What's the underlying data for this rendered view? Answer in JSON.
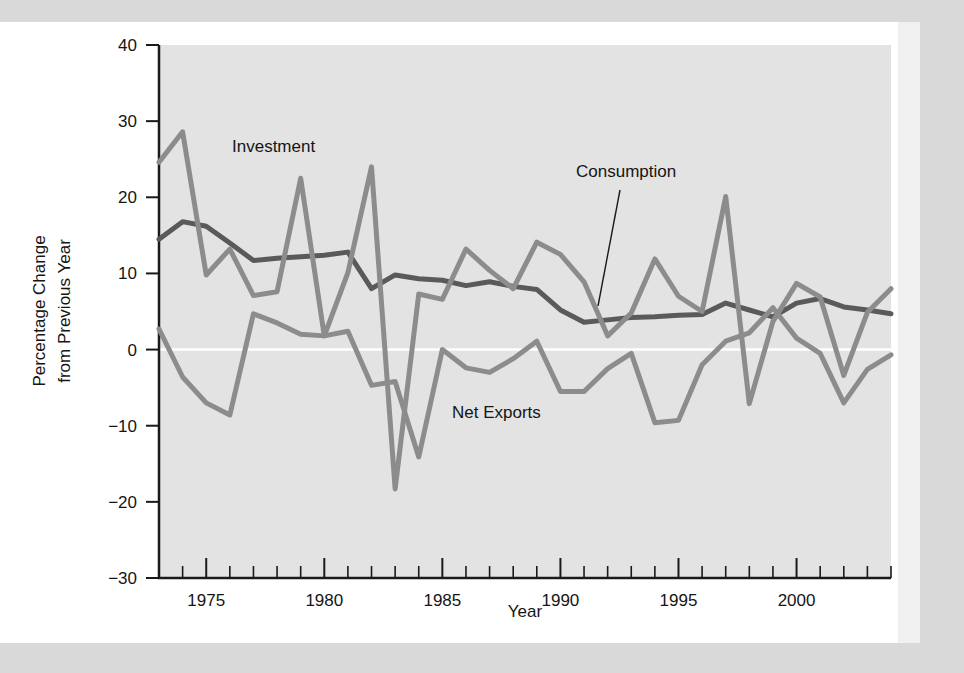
{
  "figure": {
    "background_color": "#ffffff",
    "scan_band_color": "#d9d9d9",
    "plot_background_color": "#e3e3e3",
    "axis_color": "#1a1a1a",
    "zero_line_color": "#ffffff"
  },
  "chart_data": {
    "type": "line",
    "title": "",
    "xlabel": "Year",
    "ylabel": "Percentage Change from Previous Year",
    "xlim": [
      1973,
      2004
    ],
    "ylim": [
      -30,
      40
    ],
    "yticks": [
      40,
      30,
      20,
      10,
      0,
      -10,
      -20,
      -30
    ],
    "ytick_labels": [
      "40",
      "30",
      "20",
      "10",
      "0",
      "−10",
      "−20",
      "−30"
    ],
    "xticks": [
      1975,
      1980,
      1985,
      1990,
      1995,
      2000
    ],
    "xtick_labels": [
      "1975",
      "1980",
      "1985",
      "1990",
      "1995",
      "2000"
    ],
    "x_minor_tick_interval": 1,
    "y_major_tick_interval": 10,
    "grid": false,
    "legend": "inline-annotations",
    "zero_reference_line": 0,
    "x": [
      1973,
      1974,
      1975,
      1976,
      1977,
      1978,
      1979,
      1980,
      1981,
      1982,
      1983,
      1984,
      1985,
      1986,
      1987,
      1988,
      1989,
      1990,
      1991,
      1992,
      1993,
      1994,
      1995,
      1996,
      1997,
      1998,
      1999,
      2000,
      2001,
      2002,
      2003,
      2004
    ],
    "series": [
      {
        "name": "Consumption",
        "color": "#5a5a5a",
        "width": 5,
        "values": [
          14.5,
          16.8,
          16.2,
          14.0,
          11.7,
          12.0,
          12.2,
          12.4,
          12.8,
          8.0,
          9.8,
          9.3,
          9.1,
          8.4,
          8.9,
          8.3,
          7.9,
          5.2,
          3.6,
          3.9,
          4.2,
          4.3,
          4.5,
          4.6,
          6.1,
          5.2,
          4.3,
          6.1,
          6.7,
          5.6,
          5.2,
          4.7
        ]
      },
      {
        "name": "Investment",
        "color": "#8c8c8c",
        "width": 5,
        "values": [
          24.6,
          28.6,
          9.8,
          13.2,
          7.1,
          7.6,
          22.5,
          1.8,
          10.1,
          24.0,
          -18.3,
          7.3,
          6.6,
          13.2,
          10.4,
          8.0,
          14.1,
          12.5,
          8.9,
          1.8,
          4.8,
          11.9,
          7.0,
          5.0,
          20.1,
          -7.1,
          3.7,
          8.7,
          6.9,
          -3.4,
          4.9,
          8.0
        ]
      },
      {
        "name": "Net Exports",
        "color": "#8c8c8c",
        "width": 5,
        "values": [
          2.7,
          -3.6,
          -7.0,
          -8.6,
          4.7,
          3.5,
          2.0,
          1.8,
          2.4,
          -4.7,
          -4.2,
          -14.1,
          0.0,
          -2.4,
          -3.0,
          -1.2,
          1.1,
          -5.5,
          -5.5,
          -2.5,
          -0.5,
          -9.6,
          -9.3,
          -2.0,
          1.1,
          2.2,
          5.5,
          1.5,
          -0.5,
          -7.0,
          -2.6,
          -0.7
        ]
      }
    ],
    "annotations": [
      {
        "text": "Investment",
        "x_px": 232,
        "y_px": 152,
        "has_leader": false
      },
      {
        "text": "Consumption",
        "x_px": 576,
        "y_px": 177,
        "has_leader": true,
        "leader": {
          "x1": 620,
          "y1": 190,
          "x2": 598,
          "y2": 306
        }
      },
      {
        "text": "Net Exports",
        "x_px": 452,
        "y_px": 418,
        "has_leader": false
      }
    ]
  }
}
